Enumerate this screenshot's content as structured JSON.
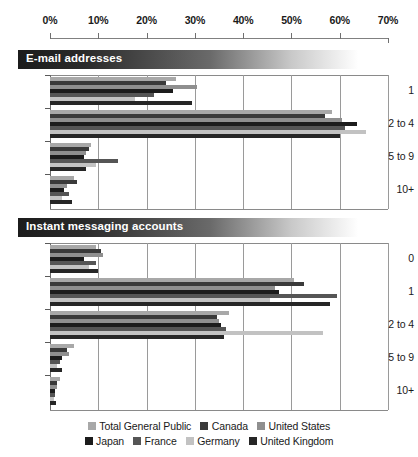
{
  "chart_data": {
    "type": "bar",
    "orientation": "horizontal",
    "title": "",
    "xlabel": "",
    "ylabel": "",
    "xlim": [
      0,
      70
    ],
    "xunit": "%",
    "grid": true,
    "legend_position": "bottom",
    "x_ticks": [
      "0%",
      "10%",
      "20%",
      "30%",
      "40%",
      "50%",
      "60%",
      "70%"
    ],
    "x_tick_values": [
      0,
      10,
      20,
      30,
      40,
      50,
      60,
      70
    ],
    "series_names": [
      "Total General Public",
      "Canada",
      "United States",
      "Japan",
      "France",
      "Germany",
      "United Kingdom"
    ],
    "series_colors": [
      "#a8a8a8",
      "#3a3a3a",
      "#8f8f8f",
      "#1c1c1c",
      "#555555",
      "#c2c2c2",
      "#262626"
    ],
    "panels": [
      {
        "title": "E-mail addresses",
        "categories": [
          "1",
          "2 to 4",
          "5 to 9",
          "10+"
        ],
        "series": [
          {
            "name": "Total General Public",
            "values": [
              26.0,
              58.5,
              8.5,
              5.0
            ]
          },
          {
            "name": "Canada",
            "values": [
              24.0,
              57.0,
              8.0,
              5.5
            ]
          },
          {
            "name": "United States",
            "values": [
              30.5,
              60.5,
              7.5,
              3.5
            ]
          },
          {
            "name": "Japan",
            "values": [
              25.5,
              63.5,
              7.0,
              3.0
            ]
          },
          {
            "name": "France",
            "values": [
              21.5,
              61.0,
              14.0,
              4.0
            ]
          },
          {
            "name": "Germany",
            "values": [
              17.5,
              65.5,
              9.5,
              2.5
            ]
          },
          {
            "name": "United Kingdom",
            "values": [
              29.5,
              60.0,
              7.5,
              4.5
            ]
          }
        ]
      },
      {
        "title": "Instant messaging accounts",
        "categories": [
          "0",
          "1",
          "2 to 4",
          "5 to 9",
          "10+"
        ],
        "series": [
          {
            "name": "Total General Public",
            "values": [
              9.5,
              50.5,
              37.0,
              5.0,
              2.0
            ]
          },
          {
            "name": "Canada",
            "values": [
              10.5,
              52.5,
              34.5,
              3.5,
              1.5
            ]
          },
          {
            "name": "United States",
            "values": [
              11.0,
              46.5,
              35.0,
              4.0,
              1.5
            ]
          },
          {
            "name": "Japan",
            "values": [
              7.0,
              47.5,
              35.5,
              2.5,
              1.0
            ]
          },
          {
            "name": "France",
            "values": [
              9.5,
              59.5,
              36.5,
              2.0,
              1.0
            ]
          },
          {
            "name": "Germany",
            "values": [
              8.0,
              45.5,
              56.5,
              1.5,
              0.8
            ]
          },
          {
            "name": "United Kingdom",
            "values": [
              10.0,
              58.0,
              36.0,
              2.5,
              1.2
            ]
          }
        ]
      }
    ]
  },
  "legend": {
    "row1": [
      {
        "label": "Total General Public",
        "color": "#a8a8a8"
      },
      {
        "label": "Canada",
        "color": "#3a3a3a"
      },
      {
        "label": "United States",
        "color": "#8f8f8f"
      }
    ],
    "row2": [
      {
        "label": "Japan",
        "color": "#1c1c1c"
      },
      {
        "label": "France",
        "color": "#555555"
      },
      {
        "label": "Germany",
        "color": "#c2c2c2"
      },
      {
        "label": "United Kingdom",
        "color": "#262626"
      }
    ]
  }
}
